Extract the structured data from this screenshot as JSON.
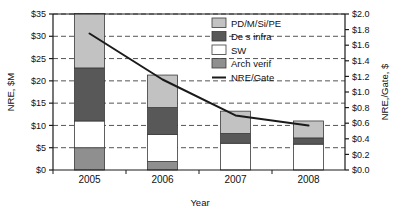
{
  "chart_data": {
    "type": "bar",
    "subtype": "stacked-bar-with-line",
    "title": "",
    "categories": [
      "2005",
      "2006",
      "2007",
      "2008"
    ],
    "xlabel": "Year",
    "ylabel": "NRE, $M",
    "y2label": "NRE,/Gate, $",
    "ylim": [
      0,
      35
    ],
    "y2lim": [
      0.0,
      2.0
    ],
    "yticks": [
      "$0",
      "$5",
      "$10",
      "$15",
      "$20",
      "$25",
      "$30",
      "$35"
    ],
    "ytick_values": [
      0,
      5,
      10,
      15,
      20,
      25,
      30,
      35
    ],
    "y2ticks": [
      "$0.0",
      "$0.2",
      "$0.4",
      "$0.6",
      "$0.8",
      "$1.0",
      "$1.2",
      "$1.4",
      "$1.6",
      "$1.8",
      "$2.0"
    ],
    "y2tick_values": [
      0.0,
      0.2,
      0.4,
      0.6,
      0.8,
      1.0,
      1.2,
      1.4,
      1.6,
      1.8,
      2.0
    ],
    "grid": true,
    "grid_style": "dashed-horizontal",
    "legend_position": "top-right",
    "stack_order_bottom_to_top": [
      "Arch verif",
      "SW",
      "De s infra",
      "PD/M/Si/PE"
    ],
    "series": [
      {
        "name": "Arch verif",
        "axis": "left",
        "color": "#8f8f8f",
        "values": [
          5.0,
          1.9,
          0.0,
          0.0
        ]
      },
      {
        "name": "SW",
        "axis": "left",
        "color": "#ffffff",
        "values": [
          6.0,
          6.1,
          6.0,
          5.8
        ]
      },
      {
        "name": "De s infra",
        "axis": "left",
        "color": "#585858",
        "values": [
          11.9,
          6.0,
          2.2,
          1.4
        ]
      },
      {
        "name": "PD/M/Si/PE",
        "axis": "left",
        "color": "#c2c2c2",
        "values": [
          12.2,
          7.3,
          5.0,
          3.8
        ]
      },
      {
        "name": "NRE/Gate",
        "axis": "right",
        "type": "line",
        "color": "#1a1a1a",
        "values": [
          1.75,
          1.16,
          0.7,
          0.57
        ]
      }
    ],
    "totals": [
      35.1,
      21.3,
      13.2,
      11.0
    ],
    "annotations": []
  },
  "legend": {
    "items": [
      {
        "label": "PD/M/Si/PE",
        "swatch": "#c2c2c2",
        "kind": "box"
      },
      {
        "label": "De s infra",
        "swatch": "#585858",
        "kind": "box"
      },
      {
        "label": "SW",
        "swatch": "#ffffff",
        "kind": "box"
      },
      {
        "label": "Arch verif",
        "swatch": "#8f8f8f",
        "kind": "box"
      },
      {
        "label": "NRE/Gate",
        "swatch": "#1a1a1a",
        "kind": "line"
      }
    ]
  },
  "axes": {
    "left_title": "NRE, $M",
    "right_title": "NRE,/Gate, $",
    "bottom_title": "Year"
  },
  "colors": {
    "pd_m_si_pe": "#c2c2c2",
    "des_infra": "#585858",
    "sw": "#ffffff",
    "arch_verif": "#8f8f8f",
    "line": "#1a1a1a",
    "axis": "#1a1a1a",
    "grid": "#555555"
  }
}
